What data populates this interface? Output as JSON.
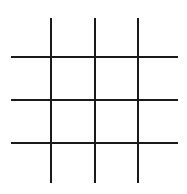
{
  "game": {
    "name": "Tic-tac-toe-like grid",
    "rows": 4,
    "cols": 4,
    "line_color": "#1a1a1a",
    "background": "#ffffff",
    "cells": [
      [
        "",
        "",
        "",
        ""
      ],
      [
        "",
        "",
        "",
        ""
      ],
      [
        "",
        "",
        "",
        ""
      ],
      [
        "",
        "",
        "",
        ""
      ]
    ]
  }
}
